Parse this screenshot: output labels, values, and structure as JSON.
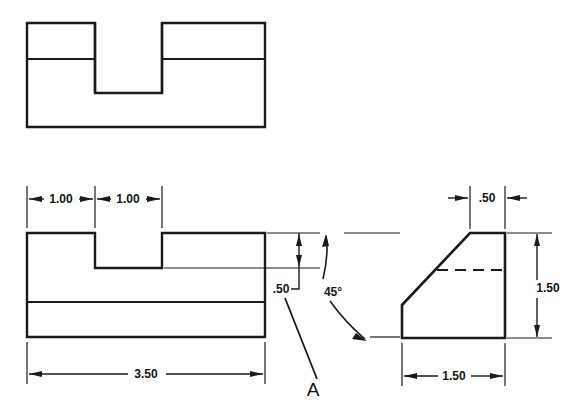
{
  "drawing": {
    "title": "Orthographic multiview engineering drawing",
    "line_color": "#1a1a1a",
    "background": "#ffffff",
    "views": {
      "top": {
        "name": "Top view",
        "outline": "rectangle with slot opening",
        "x": 27,
        "y": 23,
        "width": 238,
        "height": 104,
        "hidden_edge_y": 59,
        "slot_left": 95,
        "slot_right": 162,
        "slot_bottom": 93
      },
      "front": {
        "name": "Front view",
        "x": 27,
        "y": 233,
        "width": 238,
        "height": 104,
        "notch_left": 95,
        "notch_right": 162,
        "notch_bottom": 268,
        "base_line_y": 302
      },
      "right_side": {
        "name": "Right side view",
        "x": 402,
        "y": 233,
        "width": 103,
        "height": 105,
        "chamfer_top_x": 470,
        "chamfer_bottom_y": 305,
        "hidden_line_y": 270
      }
    },
    "dimensions": [
      {
        "id": "dim-top-1",
        "label": "1.00",
        "x": 61,
        "y": 195,
        "view": "front",
        "orientation": "horizontal"
      },
      {
        "id": "dim-top-2",
        "label": "1.00",
        "x": 128,
        "y": 195,
        "view": "front",
        "orientation": "horizontal"
      },
      {
        "id": "dim-overall-width",
        "label": "3.50",
        "x": 146,
        "y": 370,
        "view": "front",
        "orientation": "horizontal"
      },
      {
        "id": "dim-notch-depth",
        "label": ".50",
        "x": 281,
        "y": 293,
        "view": "front",
        "orientation": "vertical"
      },
      {
        "id": "dim-chamfer-top",
        "label": ".50",
        "x": 487,
        "y": 194,
        "view": "right_side",
        "orientation": "horizontal"
      },
      {
        "id": "dim-height",
        "label": "1.50",
        "x": 548,
        "y": 291,
        "view": "right_side",
        "orientation": "vertical"
      },
      {
        "id": "dim-depth",
        "label": "1.50",
        "x": 453,
        "y": 372,
        "view": "right_side",
        "orientation": "horizontal"
      }
    ],
    "annotations": [
      {
        "id": "angle-note",
        "label": "45°",
        "x": 333,
        "y": 292,
        "type": "angle-callout"
      },
      {
        "id": "surface-label-a",
        "label": "A",
        "x": 313,
        "y": 396,
        "type": "surface-letter"
      }
    ]
  }
}
